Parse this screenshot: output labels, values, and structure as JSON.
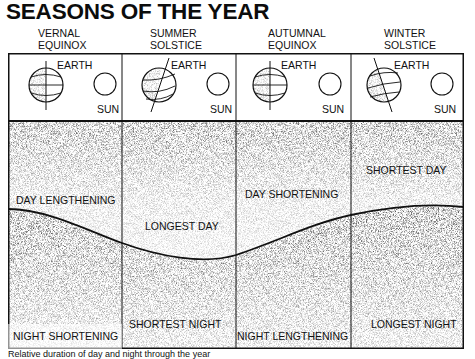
{
  "title": "SEASONS OF THE YEAR",
  "seasons": [
    {
      "name_line1": "VERNAL",
      "name_line2": "EQUINOX",
      "earth_label": "EARTH",
      "sun_label": "SUN",
      "axis_tilt": "none"
    },
    {
      "name_line1": "SUMMER",
      "name_line2": "SOLSTICE",
      "earth_label": "EARTH",
      "sun_label": "SUN",
      "axis_tilt": "toward-sun"
    },
    {
      "name_line1": "AUTUMNAL",
      "name_line2": "EQUINOX",
      "earth_label": "EARTH",
      "sun_label": "SUN",
      "axis_tilt": "none"
    },
    {
      "name_line1": "WINTER",
      "name_line2": "SOLSTICE",
      "earth_label": "EARTH",
      "sun_label": "SUN",
      "axis_tilt": "away-from-sun"
    }
  ],
  "day_labels": [
    "DAY LENGTHENING",
    "LONGEST DAY",
    "DAY SHORTENING",
    "SHORTEST DAY"
  ],
  "night_labels": [
    "NIGHT SHORTENING",
    "SHORTEST NIGHT",
    "NIGHT LENGTHENING",
    "LONGEST NIGHT"
  ],
  "caption": "Relative duration of day and night through the year",
  "colors": {
    "ink": "#111111",
    "paper": "#ffffff",
    "night_stipple": "#2a2a2a"
  }
}
